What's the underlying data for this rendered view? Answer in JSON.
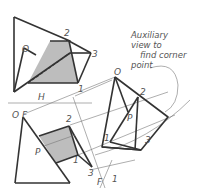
{
  "diagram": {
    "type": "descriptive-geometry-auxiliary-view",
    "fold_line_label_top": "H",
    "fold_line_label_bottom": "F",
    "aux_fold_labels": [
      "F",
      "1"
    ],
    "annotation": [
      "Auxiliary",
      "view to",
      "find corner",
      "point"
    ],
    "top_view_labels": {
      "o": "O",
      "two": "2",
      "three": "3",
      "one": "1"
    },
    "front_view_labels": {
      "of": "O F",
      "two": "2",
      "p": "P",
      "one": "1",
      "three": "3"
    },
    "aux_view_labels": {
      "o": "O",
      "two": "2",
      "p": "P",
      "one": "1",
      "three": "3"
    },
    "colors": {
      "line": "#333333",
      "shade": "#bdbdbd",
      "construction": "#777777"
    }
  }
}
